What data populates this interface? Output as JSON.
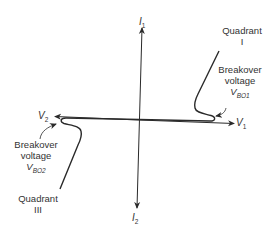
{
  "diagram": {
    "axes": {
      "x_positive": {
        "symbol": "V",
        "sub": "1"
      },
      "x_negative": {
        "symbol": "V",
        "sub": "2"
      },
      "y_positive": {
        "symbol": "I",
        "sub": "1"
      },
      "y_negative": {
        "symbol": "I",
        "sub": "2"
      }
    },
    "quadrant_1": {
      "line1": "Quadrant",
      "line2": "I"
    },
    "quadrant_3": {
      "line1": "Quadrant",
      "line2": "III"
    },
    "breakover_1": {
      "line1": "Breakover",
      "line2": "voltage",
      "symbol": "V",
      "sub": "BO1"
    },
    "breakover_2": {
      "line1": "Breakover",
      "line2": "voltage",
      "symbol": "V",
      "sub": "BO2"
    },
    "colors": {
      "stroke": "#2a2a2a",
      "background": "#ffffff"
    }
  }
}
